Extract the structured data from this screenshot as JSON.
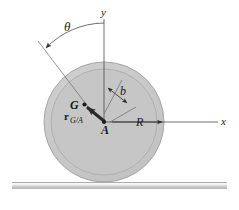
{
  "figure": {
    "labels": {
      "theta": "θ",
      "y_axis": "y",
      "x_axis": "x",
      "point_A": "A",
      "point_G": "G",
      "radius": "R",
      "offset": "b",
      "vector_main": "r",
      "vector_subscript": "G/A"
    },
    "colors": {
      "wheel_fill": "#c9c9c9",
      "wheel_inner_fill": "#c4c4c4",
      "wheel_stroke": "#9a9a9a",
      "line": "#4a4a4a",
      "vector": "#2b2b2b",
      "ground_top": "#efefef",
      "ground_bottom": "#b8b8b8",
      "background": "#ffffff",
      "text": "#1a1a1a"
    },
    "geometry": {
      "center_x": 104,
      "center_y": 122,
      "outer_radius": 60,
      "inner_radius": 53,
      "point_G_x": 84,
      "point_G_y": 105,
      "y_axis_top": 18,
      "x_axis_right": 220,
      "ground_y": 182,
      "theta_arrow_x": 45,
      "theta_arrow_y": 47
    }
  }
}
